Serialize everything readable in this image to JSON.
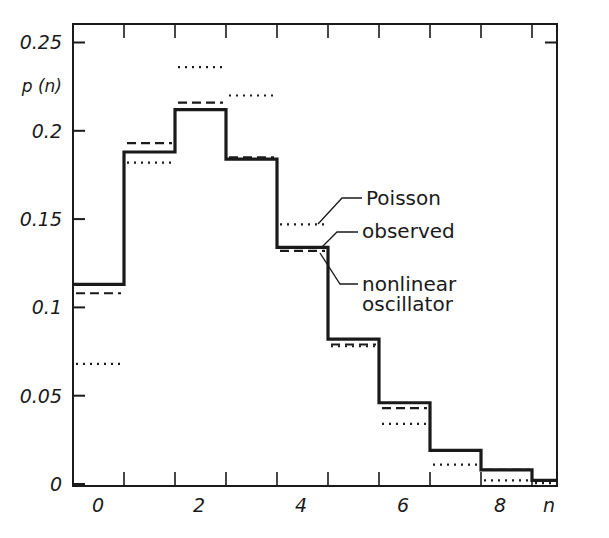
{
  "chart_data": {
    "type": "line",
    "subtype": "step-histogram",
    "title": "",
    "xlabel": "n",
    "ylabel": "p (n)",
    "xlim": [
      -0.5,
      9.0
    ],
    "ylim": [
      0,
      0.25
    ],
    "x_tick_labels": [
      "0",
      "2",
      "4",
      "6",
      "8"
    ],
    "x_tick_values": [
      0,
      2,
      4,
      6,
      8
    ],
    "y_tick_labels": [
      "0",
      "0.05",
      "0.1",
      "0.15",
      "0.2",
      "0.25"
    ],
    "y_tick_values": [
      0,
      0.05,
      0.1,
      0.15,
      0.2,
      0.25
    ],
    "grid": false,
    "categories": [
      0,
      1,
      2,
      3,
      4,
      5,
      6,
      7,
      8,
      9
    ],
    "series": [
      {
        "name": "observed",
        "style": "solid-thick",
        "values": [
          0.113,
          0.188,
          0.212,
          0.184,
          0.134,
          0.082,
          0.046,
          0.019,
          0.008,
          0.002
        ]
      },
      {
        "name": "nonlinear oscillator",
        "style": "dashed",
        "values": [
          0.108,
          0.193,
          0.216,
          0.185,
          0.132,
          0.079,
          0.043,
          0.019,
          0.008,
          0.002
        ]
      },
      {
        "name": "Poisson",
        "style": "dotted",
        "values": [
          0.068,
          0.182,
          0.236,
          0.22,
          0.147,
          0.078,
          0.034,
          0.011,
          0.002,
          0.0005
        ]
      }
    ],
    "annotations": [
      {
        "text": "Poisson",
        "target": "Poisson"
      },
      {
        "text": "observed",
        "target": "observed"
      },
      {
        "text": "nonlinear",
        "target": "nonlinear oscillator"
      },
      {
        "text": "oscillator",
        "target": "nonlinear oscillator"
      }
    ]
  },
  "labels": {
    "y_axis_title": "p (n)",
    "x_axis_title": "n",
    "y_ticks": [
      "0.25",
      "0.2",
      "0.15",
      "0.1",
      "0.05",
      "0"
    ],
    "x_ticks": [
      "0",
      "2",
      "4",
      "6",
      "8"
    ],
    "annot_poisson": "Poisson",
    "annot_observed": "observed",
    "annot_nonlinear_1": "nonlinear",
    "annot_nonlinear_2": "oscillator"
  },
  "colors": {
    "ink": "#1a1a1a",
    "background": "#ffffff"
  }
}
